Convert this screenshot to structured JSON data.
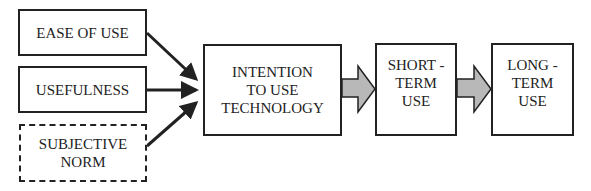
{
  "diagram": {
    "inputs": [
      {
        "label": "EASE OF USE",
        "style": "solid"
      },
      {
        "label": "USEFULNESS",
        "style": "solid"
      },
      {
        "label": "SUBJECTIVE\nNORM",
        "style": "dashed"
      }
    ],
    "stages": [
      {
        "label": "INTENTION\nTO USE\nTECHNOLOGY"
      },
      {
        "label": "SHORT -\nTERM\nUSE"
      },
      {
        "label": "LONG -\nTERM\nUSE"
      }
    ],
    "colors": {
      "line": "#222222",
      "block_arrow_fill": "#b8b8b8",
      "background": "#ffffff"
    }
  }
}
